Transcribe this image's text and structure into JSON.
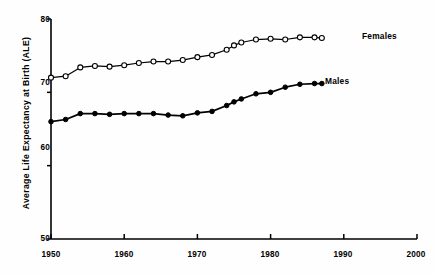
{
  "chart_data": {
    "type": "line",
    "title": "",
    "xlabel": "",
    "ylabel": "Average Life Expectancy at Birth (ALE)",
    "xlim": [
      1950,
      2000
    ],
    "ylim": [
      50,
      80
    ],
    "xticks": [
      1950,
      1960,
      1970,
      1980,
      1990,
      2000
    ],
    "yticks": [
      50,
      60,
      70,
      80
    ],
    "xtick_labels": [
      "1950",
      "1960",
      "1970",
      "1980",
      "1990",
      "2000"
    ],
    "ytick_labels": [
      "50",
      "60",
      "70",
      "80"
    ],
    "grid": false,
    "legend_position": "line-end-labels",
    "series": [
      {
        "name": "Females",
        "marker": "open-circle",
        "label": "Females",
        "x": [
          1950,
          1952,
          1954,
          1956,
          1958,
          1960,
          1962,
          1964,
          1966,
          1968,
          1970,
          1972,
          1974,
          1975,
          1976,
          1978,
          1980,
          1982,
          1984,
          1986,
          1987
        ],
        "values": [
          72.0,
          72.2,
          73.4,
          73.6,
          73.5,
          73.7,
          74.0,
          74.2,
          74.2,
          74.4,
          74.8,
          75.1,
          75.8,
          76.4,
          76.8,
          77.2,
          77.3,
          77.2,
          77.5,
          77.5,
          77.4
        ]
      },
      {
        "name": "Males",
        "marker": "filled-circle",
        "label": "Males",
        "x": [
          1950,
          1952,
          1954,
          1956,
          1958,
          1960,
          1962,
          1964,
          1966,
          1968,
          1970,
          1972,
          1974,
          1975,
          1976,
          1978,
          1980,
          1982,
          1984,
          1986,
          1987
        ],
        "values": [
          66.0,
          66.3,
          67.1,
          67.1,
          67.0,
          67.1,
          67.1,
          67.1,
          66.9,
          66.8,
          67.2,
          67.4,
          68.2,
          68.7,
          69.1,
          69.8,
          70.0,
          70.7,
          71.1,
          71.2,
          71.2
        ]
      }
    ],
    "colors": {
      "line": "#000000",
      "marker_open_fill": "#ffffff",
      "marker_filled_fill": "#000000",
      "axis": "#000000",
      "background": "#ffffff"
    }
  }
}
